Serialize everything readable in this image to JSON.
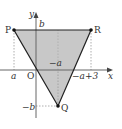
{
  "figure": {
    "type": "coordinate-plane-triangle",
    "axes": {
      "x_label": "x",
      "y_label": "y",
      "origin_label": "O"
    },
    "points": {
      "P": {
        "label": "P",
        "coord": "(a, b)"
      },
      "R": {
        "label": "R",
        "coord": "(-a+3, b)"
      },
      "Q": {
        "label": "Q",
        "coord": "(-a, -b)"
      }
    },
    "tick_labels": {
      "x_a": "a",
      "x_neg_a": "−a",
      "x_neg_a_plus_3": "−a+3",
      "y_b": "b",
      "y_neg_b": "−b"
    },
    "colors": {
      "fill": "#c8c8c8",
      "stroke": "#222222",
      "axis": "#666666",
      "dashed": "#999999"
    }
  }
}
